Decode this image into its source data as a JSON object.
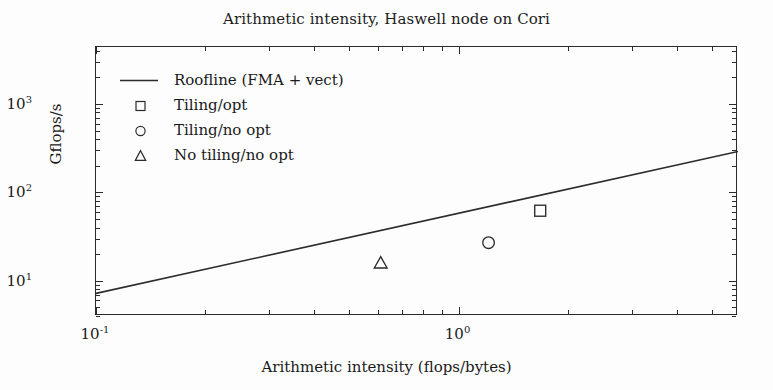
{
  "chart_data": {
    "type": "scatter",
    "title": "Arithmetic intensity, Haswell node on Cori",
    "xlabel": "Arithmetic intensity (flops/bytes)",
    "ylabel": "Gflops/s",
    "xscale": "log",
    "yscale": "log",
    "xlim": [
      0.1,
      5.9
    ],
    "ylim": [
      4.0,
      4400
    ],
    "grid": false,
    "legend_position": "upper left",
    "xticks": [
      {
        "value": 0.1,
        "label": "10",
        "exp": "-1"
      },
      {
        "value": 1.0,
        "label": "10",
        "exp": "0"
      }
    ],
    "yticks": [
      {
        "value": 10,
        "label": "10",
        "exp": "1"
      },
      {
        "value": 100,
        "label": "10",
        "exp": "2"
      },
      {
        "value": 1000,
        "label": "10",
        "exp": "3"
      }
    ],
    "series": [
      {
        "name": "Roofline (FMA + vect)",
        "type": "line",
        "marker": "line",
        "color": "#2b2b2b",
        "x": [
          0.1,
          5.9
        ],
        "y": [
          7.2,
          290.0
        ]
      },
      {
        "name": "Tiling/opt",
        "type": "scatter",
        "marker": "square",
        "color": "#2b2b2b",
        "x": [
          1.68
        ],
        "y": [
          62.0
        ]
      },
      {
        "name": "Tiling/no opt",
        "type": "scatter",
        "marker": "circle",
        "color": "#2b2b2b",
        "x": [
          1.21
        ],
        "y": [
          27.0
        ]
      },
      {
        "name": "No tiling/no opt",
        "type": "scatter",
        "marker": "triangle",
        "color": "#2b2b2b",
        "x": [
          0.61
        ],
        "y": [
          16.0
        ]
      }
    ]
  },
  "legend": {
    "items": [
      {
        "label": "Roofline (FMA + vect)",
        "marker": "line"
      },
      {
        "label": "Tiling/opt",
        "marker": "square"
      },
      {
        "label": "Tiling/no opt",
        "marker": "circle"
      },
      {
        "label": "No tiling/no opt",
        "marker": "triangle"
      }
    ]
  }
}
